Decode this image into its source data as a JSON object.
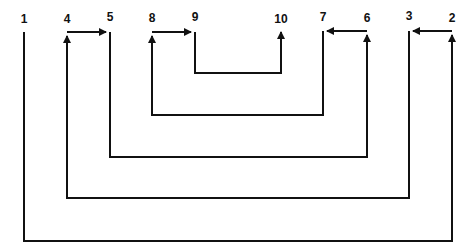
{
  "diagram": {
    "type": "nested-path-diagram",
    "line_color": "#111111",
    "background": "#ffffff",
    "nodes": [
      {
        "id": "1",
        "label": "1",
        "x": 24,
        "label_y": 13
      },
      {
        "id": "4",
        "label": "4",
        "x": 67,
        "label_y": 13
      },
      {
        "id": "5",
        "label": "5",
        "x": 110,
        "label_y": 11
      },
      {
        "id": "8",
        "label": "8",
        "x": 152,
        "label_y": 12
      },
      {
        "id": "9",
        "label": "9",
        "x": 195,
        "label_y": 11
      },
      {
        "id": "10",
        "label": "10",
        "x": 281,
        "label_y": 13
      },
      {
        "id": "7",
        "label": "7",
        "x": 323,
        "label_y": 11
      },
      {
        "id": "6",
        "label": "6",
        "x": 367,
        "label_y": 12
      },
      {
        "id": "3",
        "label": "3",
        "x": 409,
        "label_y": 10
      },
      {
        "id": "2",
        "label": "2",
        "x": 452,
        "label_y": 12
      }
    ],
    "paths": [
      {
        "from": "1",
        "to": "2",
        "bottom_y": 241,
        "note": "outermost U: 1 down, across, up to 2"
      },
      {
        "from": "2",
        "to": "3",
        "top_y": 31,
        "arrow_at": "3"
      },
      {
        "from": "3",
        "to": "4",
        "bottom_y": 198
      },
      {
        "from": "4",
        "to": "5",
        "top_y": 32,
        "arrow_at": "5"
      },
      {
        "from": "5",
        "to": "6",
        "bottom_y": 157
      },
      {
        "from": "6",
        "to": "7",
        "top_y": 31,
        "arrow_at": "7"
      },
      {
        "from": "7",
        "to": "8",
        "bottom_y": 115
      },
      {
        "from": "8",
        "to": "9",
        "top_y": 32,
        "arrow_at": "9"
      },
      {
        "from": "9",
        "to": "10",
        "bottom_y": 73,
        "arrow_at": "10"
      }
    ]
  }
}
